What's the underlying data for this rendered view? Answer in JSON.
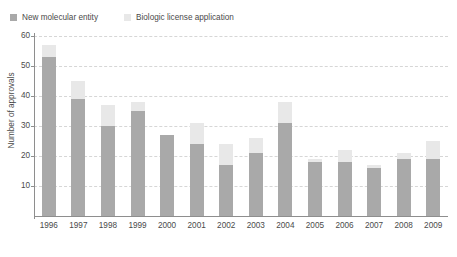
{
  "chart_data": {
    "type": "bar",
    "subtype": "stacked-vertical",
    "title": "",
    "xlabel": "",
    "ylabel": "Number of approvals",
    "ylim": [
      0,
      60
    ],
    "ytick_values": [
      0,
      10,
      20,
      30,
      40,
      50,
      60
    ],
    "ytick_labels": [
      "",
      "10",
      "20",
      "30",
      "40",
      "50",
      "60"
    ],
    "grid": "horizontal-dashed",
    "legend_position": "top-left",
    "categories": [
      "1996",
      "1997",
      "1998",
      "1999",
      "2000",
      "2001",
      "2002",
      "2003",
      "2004",
      "2005",
      "2006",
      "2007",
      "2008",
      "2009"
    ],
    "series": [
      {
        "name": "New molecular entity",
        "color": "#a9a9a9",
        "values": [
          53,
          39,
          30,
          35,
          27,
          24,
          17,
          21,
          31,
          18,
          18,
          16,
          19,
          19
        ]
      },
      {
        "name": "Biologic license application",
        "color": "#e8e8e8",
        "values": [
          4,
          6,
          7,
          3,
          0,
          7,
          7,
          5,
          7,
          1,
          4,
          1,
          2,
          6
        ]
      }
    ],
    "totals": [
      57,
      45,
      37,
      38,
      27,
      31,
      24,
      26,
      38,
      19,
      22,
      17,
      21,
      25
    ]
  },
  "legend": {
    "entries": [
      {
        "label": "New molecular entity",
        "color": "#a9a9a9"
      },
      {
        "label": "Biologic license application",
        "color": "#e8e8e8"
      }
    ]
  },
  "axes": {
    "y_title": "Number of approvals"
  },
  "caption": {
    "text": ""
  },
  "colors": {
    "axis": "#8e8e8e",
    "gridline": "#d6d6d6",
    "text": "#4a4a4a",
    "background": "#ffffff"
  }
}
